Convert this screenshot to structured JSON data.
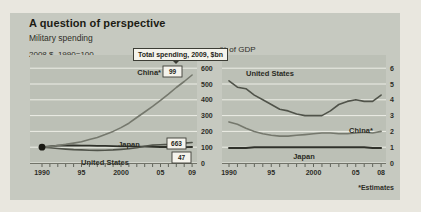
{
  "title": "A question of perspective",
  "subtitle": "Military spending",
  "footnote": "*Estimates",
  "colors": {
    "card_bg": "#c6c9c0",
    "panel_bg": "#bcc0b6",
    "gridline": "#edeee7",
    "axis": "#55584e",
    "text": "#2e2e27",
    "box_bg": "#f4f3ec",
    "box_border": "#3c3d35",
    "dot": "#191913"
  },
  "chart_data": [
    {
      "id": "index",
      "type": "line",
      "title": "2008 $, 1990=100",
      "callout": "Total spending, 2009, $bn",
      "x_start": 1990,
      "x_end": 2009,
      "x_tick_years": [
        1990,
        1995,
        2000,
        2005,
        2009
      ],
      "x_tick_labels": [
        "1990",
        "95",
        "2000",
        "05",
        "09"
      ],
      "y_ticks": [
        0,
        100,
        200,
        300,
        400,
        500,
        600
      ],
      "ylim": [
        0,
        640
      ],
      "base_dot": {
        "year": 1990,
        "value": 100
      },
      "series": [
        {
          "name": "Japan",
          "label": "Japan",
          "value_box": "47",
          "color": "#2f312a",
          "width": 1.8,
          "values": [
            100,
            106,
            110,
            111,
            111,
            110,
            110,
            109,
            108,
            107,
            106,
            105,
            104,
            103,
            102,
            101,
            101,
            100,
            100,
            101
          ]
        },
        {
          "name": "United States",
          "label": "United States",
          "value_box": "663",
          "color": "#50534a",
          "width": 1.6,
          "values": [
            100,
            96,
            92,
            88,
            85,
            83,
            81,
            80,
            81,
            83,
            86,
            90,
            97,
            106,
            113,
            116,
            118,
            121,
            126,
            130
          ]
        },
        {
          "name": "China*",
          "label": "China*",
          "value_box": "99",
          "color": "#75786d",
          "width": 1.6,
          "values": [
            100,
            104,
            111,
            118,
            126,
            135,
            148,
            162,
            180,
            200,
            224,
            252,
            288,
            323,
            358,
            396,
            436,
            478,
            516,
            557
          ]
        }
      ]
    },
    {
      "id": "gdp",
      "type": "line",
      "title": "% of GDP",
      "x_start": 1990,
      "x_end": 2008,
      "x_tick_years": [
        1990,
        1995,
        2000,
        2005,
        2008
      ],
      "x_tick_labels": [
        "1990",
        "95",
        "2000",
        "05",
        "08"
      ],
      "y_ticks": [
        0,
        1,
        2,
        3,
        4,
        5,
        6
      ],
      "ylim": [
        0,
        6.8
      ],
      "series": [
        {
          "name": "United States",
          "label": "United States",
          "color": "#50534a",
          "width": 1.6,
          "values": [
            5.2,
            4.8,
            4.7,
            4.3,
            4.0,
            3.7,
            3.4,
            3.3,
            3.1,
            3.0,
            3.0,
            3.0,
            3.3,
            3.7,
            3.9,
            4.0,
            3.9,
            3.9,
            4.3
          ]
        },
        {
          "name": "China*",
          "label": "China*",
          "color": "#75786d",
          "width": 1.6,
          "values": [
            2.6,
            2.45,
            2.2,
            2.0,
            1.85,
            1.75,
            1.7,
            1.7,
            1.75,
            1.8,
            1.85,
            1.9,
            1.9,
            1.85,
            1.85,
            1.9,
            1.95,
            1.9,
            2.0
          ]
        },
        {
          "name": "Japan",
          "label": "Japan",
          "color": "#2f312a",
          "width": 1.9,
          "values": [
            0.95,
            0.95,
            0.95,
            1.0,
            1.0,
            1.0,
            1.0,
            1.0,
            1.0,
            1.0,
            1.0,
            1.0,
            1.0,
            1.0,
            1.0,
            1.0,
            1.0,
            0.95,
            0.95
          ]
        }
      ]
    }
  ]
}
